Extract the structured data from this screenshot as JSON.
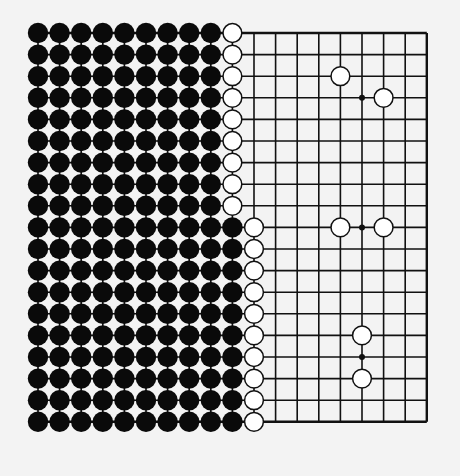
{
  "diagram": {
    "type": "go-board",
    "size": 19,
    "colors": {
      "background": "#f3f3f3",
      "line": "#111111",
      "black_stone": "#0a0a0a",
      "white_stone": "#ffffff"
    },
    "layout": {
      "origin_x": 38,
      "origin_y": 33,
      "spacing": 21.6,
      "stone_radius": 10.2
    },
    "visible_board_region": {
      "from_col": 10,
      "to_col": 19,
      "note": "grid lines drawn only from col 11 rightward plus connecting lines between stones"
    },
    "black_territory": [
      {
        "rows": [
          1,
          9
        ],
        "cols": [
          1,
          9
        ]
      },
      {
        "rows": [
          10,
          19
        ],
        "cols": [
          1,
          10
        ]
      }
    ],
    "white_wall": [
      {
        "rows": [
          1,
          9
        ],
        "col": 10
      },
      {
        "rows": [
          10,
          19
        ],
        "col": 11
      }
    ],
    "white_stones_extra": [
      {
        "row": 3,
        "col": 15
      },
      {
        "row": 4,
        "col": 17
      },
      {
        "row": 10,
        "col": 15
      },
      {
        "row": 10,
        "col": 17
      },
      {
        "row": 15,
        "col": 16
      },
      {
        "row": 17,
        "col": 16
      }
    ],
    "star_points": [
      {
        "row": 4,
        "col": 16
      },
      {
        "row": 10,
        "col": 16
      },
      {
        "row": 16,
        "col": 16
      }
    ]
  }
}
